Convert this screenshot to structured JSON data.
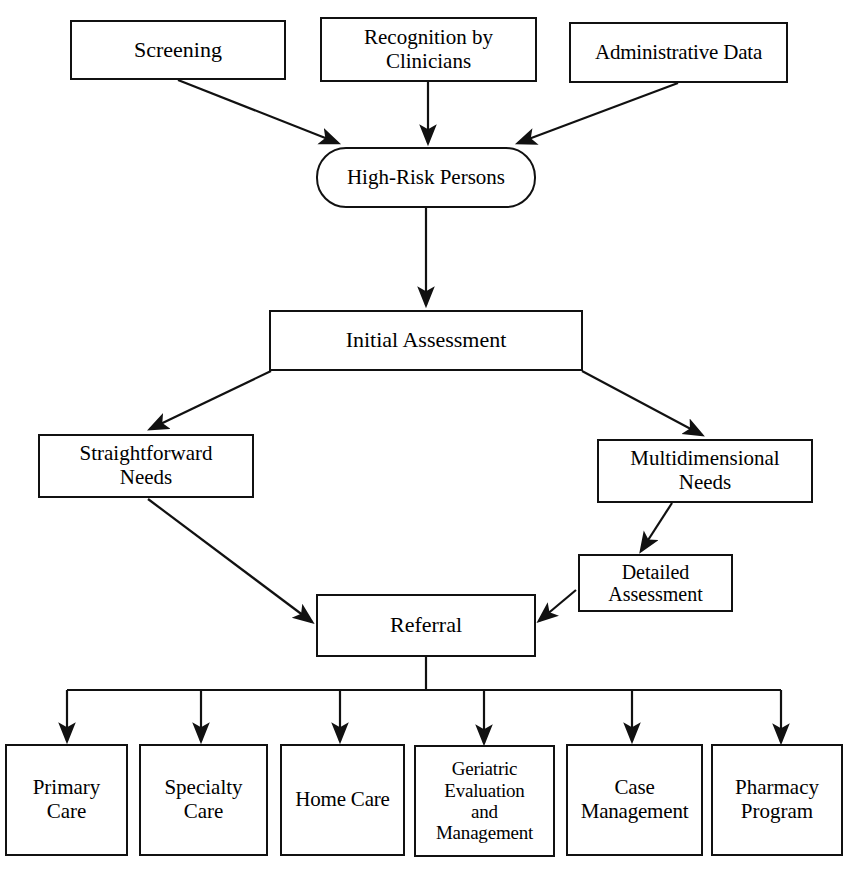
{
  "diagram": {
    "background_color": "#ffffff",
    "line_color": "#111111",
    "text_color": "#000000",
    "nodes": {
      "screening": {
        "label": "Screening"
      },
      "recognition": {
        "label": "Recognition by\nClinicians"
      },
      "administrative_data": {
        "label": "Administrative Data"
      },
      "high_risk_persons": {
        "label": "High-Risk Persons"
      },
      "initial_assessment": {
        "label": "Initial Assessment"
      },
      "straightforward_needs": {
        "label": "Straightforward\nNeeds"
      },
      "multidimensional_needs": {
        "label": "Multidimensional\nNeeds"
      },
      "detailed_assessment": {
        "label": "Detailed\nAssessment"
      },
      "referral": {
        "label": "Referral"
      },
      "primary_care": {
        "label": "Primary\nCare"
      },
      "specialty_care": {
        "label": "Specialty\nCare"
      },
      "home_care": {
        "label": "Home Care"
      },
      "geriatric_evaluation": {
        "label": "Geriatric\nEvaluation\nand\nManagement"
      },
      "case_management": {
        "label": "Case\nManagement"
      },
      "pharmacy_program": {
        "label": "Pharmacy\nProgram"
      }
    },
    "edges": [
      {
        "from": "screening",
        "to": "high_risk_persons",
        "style": "diagonal-arrow"
      },
      {
        "from": "recognition",
        "to": "high_risk_persons",
        "style": "straight-arrow"
      },
      {
        "from": "administrative_data",
        "to": "high_risk_persons",
        "style": "diagonal-arrow"
      },
      {
        "from": "high_risk_persons",
        "to": "initial_assessment",
        "style": "straight-arrow"
      },
      {
        "from": "initial_assessment",
        "to": "straightforward_needs",
        "style": "diagonal-arrow"
      },
      {
        "from": "initial_assessment",
        "to": "multidimensional_needs",
        "style": "diagonal-arrow"
      },
      {
        "from": "multidimensional_needs",
        "to": "detailed_assessment",
        "style": "diagonal-arrow"
      },
      {
        "from": "straightforward_needs",
        "to": "referral",
        "style": "diagonal-arrow"
      },
      {
        "from": "detailed_assessment",
        "to": "referral",
        "style": "diagonal-arrow"
      },
      {
        "from": "referral",
        "to": "primary_care",
        "style": "bus-arrow"
      },
      {
        "from": "referral",
        "to": "specialty_care",
        "style": "bus-arrow"
      },
      {
        "from": "referral",
        "to": "home_care",
        "style": "bus-arrow"
      },
      {
        "from": "referral",
        "to": "geriatric_evaluation",
        "style": "bus-arrow"
      },
      {
        "from": "referral",
        "to": "case_management",
        "style": "bus-arrow"
      },
      {
        "from": "referral",
        "to": "pharmacy_program",
        "style": "bus-arrow"
      }
    ]
  }
}
